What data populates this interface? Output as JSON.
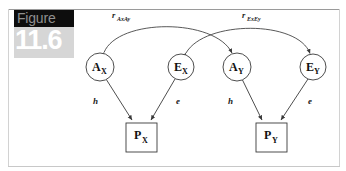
{
  "figure": {
    "badge_word": "Figure",
    "badge_number": "11.6",
    "badge_word_bg": "#0d0d0d",
    "badge_word_color": "#8f8f8f",
    "badge_num_bg": "#d6d6d6",
    "badge_num_color": "#ffffff"
  },
  "diagram": {
    "type": "path-diagram",
    "stroke_color": "#3a3a3a",
    "node_fill": "#ffffff",
    "latent_nodes": [
      {
        "id": "AX",
        "base": "A",
        "sub": "X",
        "shape": "circle",
        "cx": 100,
        "cy": 67,
        "r": 14
      },
      {
        "id": "EX",
        "base": "E",
        "sub": "X",
        "shape": "circle",
        "cx": 181,
        "cy": 67,
        "r": 13
      },
      {
        "id": "AY",
        "base": "A",
        "sub": "Y",
        "shape": "circle",
        "cx": 237,
        "cy": 67,
        "r": 14
      },
      {
        "id": "EY",
        "base": "E",
        "sub": "Y",
        "shape": "circle",
        "cx": 313,
        "cy": 67,
        "r": 13
      }
    ],
    "observed_nodes": [
      {
        "id": "PX",
        "base": "P",
        "sub": "X",
        "shape": "square",
        "x": 126,
        "y": 123,
        "w": 31,
        "h": 29
      },
      {
        "id": "PY",
        "base": "P",
        "sub": "Y",
        "shape": "square",
        "x": 256,
        "y": 123,
        "w": 31,
        "h": 29
      }
    ],
    "paths": [
      {
        "from": "AX",
        "to": "PX",
        "label": "h",
        "label_x": 93,
        "label_y": 104
      },
      {
        "from": "EX",
        "to": "PX",
        "label": "e",
        "label_x": 176,
        "label_y": 104
      },
      {
        "from": "AY",
        "to": "PY",
        "label": "h",
        "label_x": 228,
        "label_y": 104
      },
      {
        "from": "EY",
        "to": "PY",
        "label": "e",
        "label_x": 308,
        "label_y": 104
      }
    ],
    "correlations": [
      {
        "id": "rAxAy",
        "base": "r",
        "sub": "AxAy",
        "between": [
          "AX",
          "AY"
        ],
        "label_x": 112,
        "label_y": 18
      },
      {
        "id": "rExEy",
        "base": "r",
        "sub": "ExEy",
        "between": [
          "EX",
          "EY"
        ],
        "label_x": 242,
        "label_y": 18
      }
    ]
  }
}
